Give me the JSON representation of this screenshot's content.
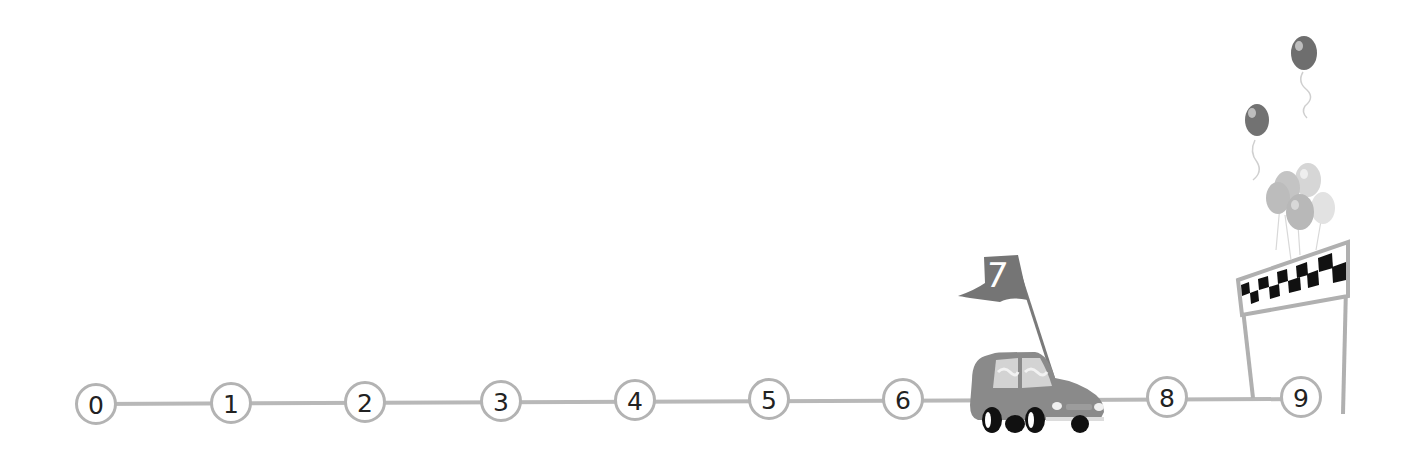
{
  "number_line": {
    "start": 0,
    "end": 9,
    "labels": [
      "0",
      "1",
      "2",
      "3",
      "4",
      "5",
      "6",
      "7",
      "8",
      "9"
    ],
    "line_color": "#b3b3b3",
    "node_border_color": "#b3b3b3"
  },
  "car": {
    "position": "7",
    "flag_label": "7",
    "flag_color": "#7a7a7a",
    "body_color": "#8a8a8a"
  },
  "finish": {
    "at": "9",
    "banner": "checkered-flag",
    "balloons": 7
  }
}
